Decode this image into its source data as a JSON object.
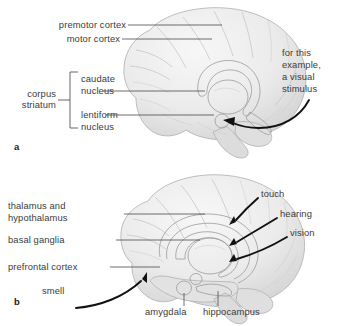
{
  "figure": {
    "type": "anatomical-diagram",
    "background_color": "#ffffff",
    "text_color": "#3b3b3b",
    "arrow_color": "#111111",
    "brain_fill": "#ededed",
    "brain_outline": "#b4b4b4",
    "deep_structure_fill": "#b8b8b8"
  },
  "panel_a": {
    "letter": "a",
    "labels": {
      "premotor_cortex": "premotor cortex",
      "motor_cortex": "motor cortex",
      "corpus": "corpus",
      "striatum": "striatum",
      "caudate": "caudate",
      "caudate_nucleus": "nucleus",
      "lentiform": "lentiform",
      "lentiform_nucleus": "nucleus",
      "stimulus_line1": "for this",
      "stimulus_line2": "example,",
      "stimulus_line3": "a visual",
      "stimulus_line4": "stimulus"
    }
  },
  "panel_b": {
    "letter": "b",
    "labels": {
      "thalamus_line1": "thalamus and",
      "thalamus_line2": "hypothalamus",
      "basal_ganglia": "basal ganglia",
      "prefrontal_cortex": "prefrontal cortex",
      "smell": "smell",
      "amygdala": "amygdala",
      "hippocampus": "hippocampus",
      "touch": "touch",
      "hearing": "hearing",
      "vision": "vision"
    }
  }
}
